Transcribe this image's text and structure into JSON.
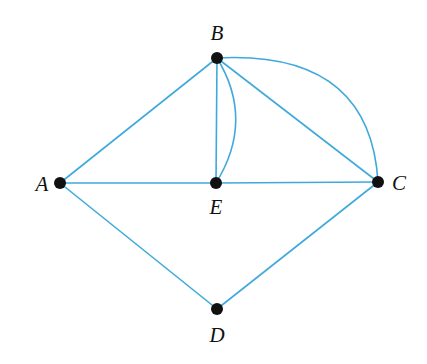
{
  "diagram": {
    "type": "graph",
    "edge_color": "#3fa9dc",
    "node_color": "#111111",
    "nodes": [
      {
        "id": "A",
        "label": "A",
        "x": 60,
        "y": 183,
        "lx": 42,
        "ly": 191
      },
      {
        "id": "B",
        "label": "B",
        "x": 217,
        "y": 58,
        "lx": 217,
        "ly": 40
      },
      {
        "id": "C",
        "label": "C",
        "x": 378,
        "y": 182,
        "lx": 399,
        "ly": 190
      },
      {
        "id": "D",
        "label": "D",
        "x": 217,
        "y": 309,
        "lx": 217,
        "ly": 342
      },
      {
        "id": "E",
        "label": "E",
        "x": 216,
        "y": 183,
        "lx": 216,
        "ly": 214
      }
    ],
    "edges": [
      {
        "from": "A",
        "to": "B",
        "shape": "straight"
      },
      {
        "from": "A",
        "to": "E",
        "shape": "straight"
      },
      {
        "from": "E",
        "to": "C",
        "shape": "straight"
      },
      {
        "from": "A",
        "to": "D",
        "shape": "straight"
      },
      {
        "from": "D",
        "to": "C",
        "shape": "straight"
      },
      {
        "from": "B",
        "to": "E",
        "shape": "straight"
      },
      {
        "from": "B",
        "to": "E",
        "shape": "curved"
      },
      {
        "from": "B",
        "to": "C",
        "shape": "straight"
      },
      {
        "from": "B",
        "to": "C",
        "shape": "curved"
      }
    ]
  }
}
